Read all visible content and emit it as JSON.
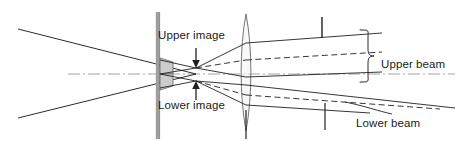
{
  "figure": {
    "type": "optical-ray-diagram",
    "width": 464,
    "height": 143,
    "background_color": "#ffffff",
    "line_color": "#231f20",
    "axis_color": "#8c8c8c",
    "glass_fill_color": "#c9c9c9",
    "glass_stroke_color": "#6e6e6e"
  },
  "labels": {
    "upper_image": "Upper image",
    "lower_image": "Lower image",
    "upper_beam": "Upper beam",
    "lower_beam": "Lower beam"
  },
  "icons": {
    "upper_image_arrow": "arrow-down-icon",
    "lower_image_arrow": "arrow-up-icon",
    "upper_beam_brace": "curly-brace-icon"
  },
  "components": {
    "optical_axis": "dash-dot horizontal axis",
    "aperture_bar": "vertical barrier bar",
    "biprism": "grey double-wedge prism",
    "lens": "biconvex lens",
    "tick_upper": "vertical tick marker on upper beam",
    "tick_lower": "vertical tick marker on lower beam",
    "lens_tick": "vertical tick marker below lens"
  }
}
